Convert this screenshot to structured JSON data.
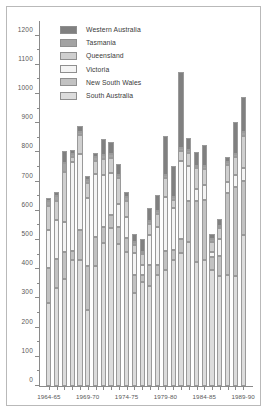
{
  "chart_data": {
    "type": "bar",
    "subtype": "stacked-bar",
    "title": "",
    "xlabel": "",
    "ylabel": "",
    "ylim": [
      0,
      1250
    ],
    "ytick_step": 100,
    "yticks": [
      0,
      100,
      200,
      300,
      400,
      500,
      600,
      700,
      800,
      900,
      1000,
      1100,
      1200
    ],
    "ytick_labels": [
      "0",
      "100",
      "200",
      "300",
      "400",
      "500",
      "600",
      "700",
      "800",
      "900",
      "1000",
      "1100",
      "1200"
    ],
    "grid": false,
    "legend_position": "top-center-inside",
    "categories": [
      "1964-65",
      "1965-66",
      "1966-67",
      "1967-68",
      "1968-69",
      "1969-70",
      "1970-71",
      "1971-72",
      "1972-73",
      "1973-74",
      "1974-75",
      "1975-76",
      "1976-77",
      "1977-78",
      "1978-79",
      "1979-80",
      "1980-81",
      "1981-82",
      "1982-83",
      "1983-84",
      "1984-85",
      "1985-86",
      "1986-87",
      "1987-88",
      "1988-89",
      "1989-90"
    ],
    "xtick_labels": [
      "1964-65",
      "1969-70",
      "1974-75",
      "1979-80",
      "1984-85",
      "1989-90"
    ],
    "xtick_indices": [
      0,
      5,
      10,
      15,
      20,
      25
    ],
    "stack_order_bottom_to_top": [
      "South Australia",
      "New South Wales",
      "Victoria",
      "Queensland",
      "Tasmania",
      "Western Australia"
    ],
    "series": [
      {
        "name": "South Australia",
        "color": "#dcdcdc",
        "values": [
          286,
          334,
          368,
          430,
          430,
          262,
          410,
          490,
          540,
          488,
          460,
          318,
          355,
          342,
          380,
          398,
          430,
          455,
          494,
          423,
          430,
          398,
          378,
          380,
          376,
          516
        ]
      },
      {
        "name": "New South Wales",
        "color": "#c2c2c2",
        "values": [
          119,
          102,
          92,
          31,
          105,
          149,
          100,
          56,
          46,
          57,
          48,
          63,
          26,
          72,
          36,
          66,
          36,
          49,
          140,
          212,
          208,
          44,
          66,
          280,
          305,
          186
        ]
      },
      {
        "name": "Victoria",
        "color": "#f4f4f4",
        "values": [
          128,
          131,
          102,
          306,
          260,
          234,
          215,
          178,
          145,
          79,
          71,
          74,
          34,
          103,
          128,
          184,
          142,
          268,
          118,
          40,
          52,
          16,
          60,
          40,
          42,
          44
        ]
      },
      {
        "name": "Queensland",
        "color": "#cfcfcf",
        "values": [
          84,
          67,
          172,
          16,
          64,
          51,
          46,
          52,
          51,
          89,
          55,
          28,
          36,
          38,
          46,
          64,
          30,
          33,
          46,
          70,
          54,
          35,
          36,
          56,
          60,
          110
        ]
      },
      {
        "name": "Tasmania",
        "color": "#a3a3a3",
        "values": [
          18,
          17,
          29,
          10,
          12,
          11,
          12,
          14,
          13,
          11,
          12,
          9,
          9,
          10,
          10,
          11,
          9,
          10,
          11,
          10,
          10,
          9,
          9,
          10,
          10,
          13
        ]
      },
      {
        "name": "Western Australia",
        "color": "#808080",
        "values": [
          10,
          14,
          43,
          15,
          18,
          11,
          16,
          55,
          42,
          38,
          18,
          30,
          42,
          46,
          54,
          132,
          108,
          262,
          42,
          46,
          72,
          20,
          23,
          18,
          110,
          122
        ]
      }
    ]
  },
  "legend": {
    "items": [
      {
        "label": "Western Australia",
        "color": "#808080"
      },
      {
        "label": "Tasmania",
        "color": "#a3a3a3"
      },
      {
        "label": "Queensland",
        "color": "#cfcfcf"
      },
      {
        "label": "Victoria",
        "color": "#f4f4f4"
      },
      {
        "label": "New South Wales",
        "color": "#c2c2c2"
      },
      {
        "label": "South Australia",
        "color": "#dcdcdc"
      }
    ]
  }
}
